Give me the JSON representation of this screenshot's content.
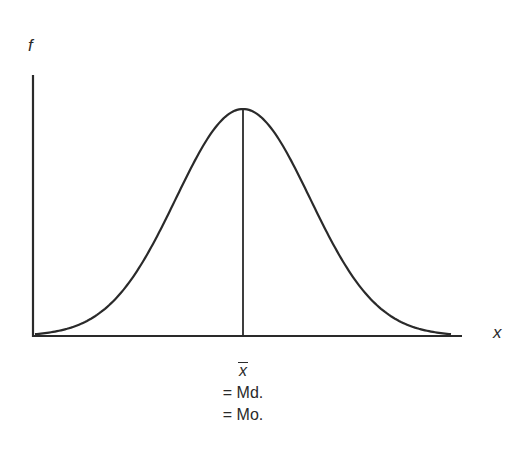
{
  "chart_data": {
    "type": "line",
    "title": "",
    "xlabel": "x",
    "ylabel": "f",
    "series": [
      {
        "name": "frequency curve",
        "x": [
          -3,
          -2.5,
          -2,
          -1.5,
          -1,
          -0.5,
          0,
          0.5,
          1,
          1.5,
          2,
          2.5,
          3
        ],
        "values": [
          0.011,
          0.044,
          0.135,
          0.325,
          0.607,
          0.882,
          1.0,
          0.882,
          0.607,
          0.325,
          0.135,
          0.044,
          0.011
        ]
      }
    ],
    "annotations": [
      {
        "type": "vline",
        "x": 0,
        "label_lines": [
          "x̄",
          "= Md.",
          "= Mo."
        ]
      }
    ],
    "xlim": [
      -3.1,
      3.6
    ],
    "ylim": [
      0,
      1.12
    ],
    "grid": false,
    "legend": null,
    "ticks": false
  },
  "labels": {
    "y_axis": "f",
    "x_axis": "x",
    "mean_symbol": "x",
    "median_line": "= Md.",
    "mode_line": "= Mo."
  },
  "colors": {
    "line": "#2a2a2a",
    "background": "#ffffff"
  }
}
